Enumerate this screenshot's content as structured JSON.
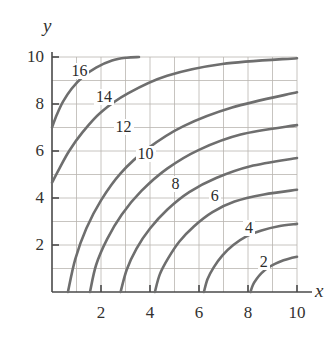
{
  "figure": {
    "kind": "contour-plot",
    "background": "#ffffff",
    "axis_color": "#4a4a4a",
    "grid_color": "#b9b5b0",
    "contour_color": "#6e6e6e",
    "text_color": "#33312f"
  },
  "axes": {
    "x_axis_label": "x",
    "y_axis_label": "y",
    "x_ticks": [
      "2",
      "4",
      "6",
      "8",
      "10"
    ],
    "y_ticks": [
      "2",
      "4",
      "6",
      "8",
      "10"
    ]
  },
  "chart_data": {
    "type": "line",
    "title": "",
    "subtitle": "",
    "xlabel": "x",
    "ylabel": "y",
    "xlim": [
      0,
      10
    ],
    "ylim": [
      0,
      10
    ],
    "xticks": [
      2,
      4,
      6,
      8,
      10
    ],
    "yticks": [
      2,
      4,
      6,
      8,
      10
    ],
    "grid": true,
    "minor_grid_step": 1,
    "legend": "none",
    "plot_kind": "contour",
    "level_label_text": [
      "2",
      "4",
      "6",
      "8",
      "10",
      "12",
      "14",
      "16"
    ],
    "levels": [
      2,
      4,
      6,
      8,
      10,
      12,
      14,
      16
    ],
    "level_annotations": [
      {
        "label": "2",
        "x": 8.6,
        "y": 1.25
      },
      {
        "label": "4",
        "x": 8.0,
        "y": 2.7
      },
      {
        "label": "6",
        "x": 6.6,
        "y": 4.05
      },
      {
        "label": "8",
        "x": 5.0,
        "y": 4.55
      },
      {
        "label": "10",
        "x": 3.8,
        "y": 5.85
      },
      {
        "label": "12",
        "x": 2.9,
        "y": 7.0
      },
      {
        "label": "14",
        "x": 2.1,
        "y": 8.25
      },
      {
        "label": "16",
        "x": 1.1,
        "y": 9.35
      }
    ],
    "series": [
      {
        "name": "level-2",
        "label": "2",
        "x": [
          8.1,
          8.2,
          8.35,
          8.55,
          8.8,
          9.1,
          9.45,
          9.7,
          10.0
        ],
        "y": [
          0.0,
          0.3,
          0.55,
          0.8,
          1.02,
          1.2,
          1.35,
          1.43,
          1.5
        ]
      },
      {
        "name": "level-4",
        "label": "4",
        "x": [
          6.2,
          6.35,
          6.6,
          6.95,
          7.4,
          7.95,
          8.55,
          9.25,
          10.0
        ],
        "y": [
          0.0,
          0.55,
          1.05,
          1.55,
          2.0,
          2.38,
          2.62,
          2.8,
          2.9
        ]
      },
      {
        "name": "level-6",
        "label": "6",
        "x": [
          4.2,
          4.4,
          4.75,
          5.2,
          5.8,
          6.55,
          7.45,
          8.65,
          10.0
        ],
        "y": [
          0.0,
          0.75,
          1.45,
          2.15,
          2.8,
          3.4,
          3.85,
          4.15,
          4.35
        ]
      },
      {
        "name": "level-8",
        "label": "8",
        "x": [
          2.8,
          3.05,
          3.45,
          4.0,
          4.7,
          5.6,
          6.7,
          8.1,
          10.0
        ],
        "y": [
          0.0,
          0.95,
          1.85,
          2.7,
          3.5,
          4.25,
          4.85,
          5.35,
          5.7
        ]
      },
      {
        "name": "level-10",
        "label": "10",
        "x": [
          1.55,
          1.8,
          2.25,
          2.85,
          3.65,
          4.7,
          6.0,
          7.7,
          10.0
        ],
        "y": [
          0.0,
          1.15,
          2.25,
          3.3,
          4.3,
          5.25,
          6.05,
          6.7,
          7.1
        ]
      },
      {
        "name": "level-12",
        "label": "12",
        "x": [
          0.65,
          0.95,
          1.4,
          2.0,
          2.8,
          3.9,
          5.35,
          7.35,
          10.0
        ],
        "y": [
          0.0,
          1.4,
          2.7,
          3.9,
          5.05,
          6.1,
          7.05,
          7.85,
          8.5
        ]
      },
      {
        "name": "level-14",
        "label": "14",
        "x": [
          0.0,
          0.3,
          0.7,
          1.25,
          2.0,
          3.1,
          4.7,
          6.95,
          10.0
        ],
        "y": [
          4.65,
          5.25,
          6.0,
          6.8,
          7.65,
          8.45,
          9.2,
          9.7,
          9.95
        ]
      },
      {
        "name": "level-16",
        "label": "16",
        "x": [
          0.0,
          0.2,
          0.45,
          0.8,
          1.25,
          1.8,
          2.45,
          3.05,
          3.55
        ],
        "y": [
          7.0,
          7.55,
          8.1,
          8.65,
          9.15,
          9.55,
          9.85,
          9.97,
          10.0
        ]
      }
    ]
  }
}
